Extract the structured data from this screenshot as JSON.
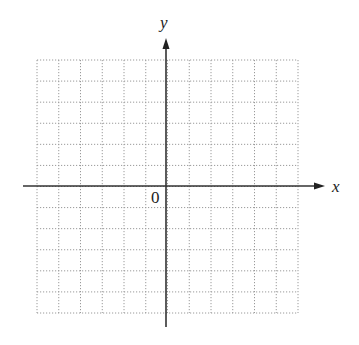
{
  "diagram": {
    "type": "coordinate-plane",
    "grid": {
      "columns": 12,
      "rows": 12,
      "left": 37,
      "top": 60,
      "right": 298,
      "bottom": 313,
      "line_style": "dotted",
      "line_color": "#9a9a9a"
    },
    "axes": {
      "color": "#333333",
      "x_axis": {
        "label": "x",
        "y": 186,
        "x_start": 23,
        "x_end": 325
      },
      "y_axis": {
        "label": "y",
        "x": 166,
        "y_start": 327,
        "y_end": 38
      },
      "origin_label": "0"
    }
  }
}
